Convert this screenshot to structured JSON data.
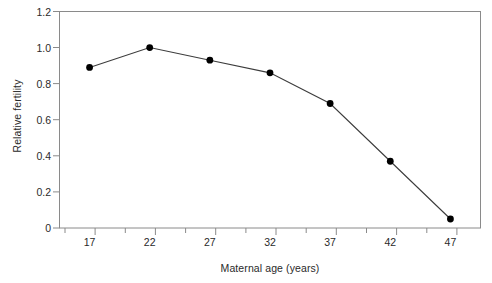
{
  "chart_data": {
    "type": "line",
    "title": "",
    "xlabel": "Maternal age (years)",
    "ylabel": "Relative fertility",
    "x": [
      17,
      22,
      27,
      32,
      37,
      42,
      47
    ],
    "values": [
      0.89,
      1.0,
      0.93,
      0.86,
      0.69,
      0.37,
      0.05
    ],
    "series": [
      {
        "name": "Relative fertility",
        "values": [
          0.89,
          1.0,
          0.93,
          0.86,
          0.69,
          0.37,
          0.05
        ]
      }
    ],
    "xlim": [
      14.5,
      49.5
    ],
    "ylim": [
      0,
      1.2
    ],
    "xticks": [
      17,
      22,
      27,
      32,
      37,
      42,
      47
    ],
    "xtick_labels": [
      "17",
      "22",
      "27",
      "32",
      "37",
      "42",
      "47"
    ],
    "xminor_ticks": [
      19.5,
      24.5,
      29.5,
      34.5,
      39.5,
      44.5
    ],
    "yticks": [
      0,
      0.2,
      0.4,
      0.6,
      0.8,
      1.0,
      1.2
    ],
    "ytick_labels": [
      "0",
      "0.2",
      "0.4",
      "0.6",
      "0.8",
      "1.0",
      "1.2"
    ],
    "grid": false,
    "legend": "none",
    "marker": "circle-filled",
    "line_color": "#3c3c3c",
    "marker_color": "#000000",
    "frame_color": "#888888",
    "background_color": "#ffffff"
  },
  "figure": {
    "caption_fragment": ""
  }
}
